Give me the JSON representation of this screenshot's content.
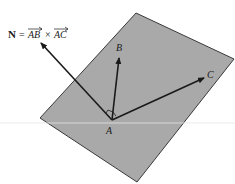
{
  "diagram": {
    "equation": {
      "lhs": "N",
      "equals": "=",
      "vec1": "AB",
      "times": "×",
      "vec2": "AC"
    },
    "points": {
      "A": "A",
      "B": "B",
      "C": "C"
    },
    "colors": {
      "plane_fill": "#a9a9a9",
      "plane_edge": "#3a3a3a",
      "arrow": "#1a1a1a",
      "background": "#ffffff"
    }
  }
}
